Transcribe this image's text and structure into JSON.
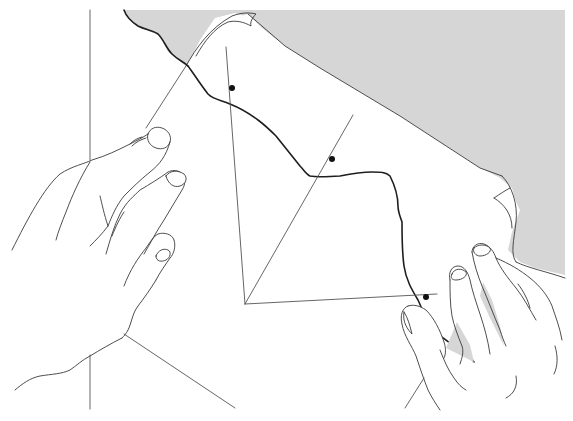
{
  "figure": {
    "description": "Two hands holding a sheet of paper with an angle construction drawn on it; a wavy traced line crosses the sheet, three marked points",
    "colors": {
      "background": "#ffffff",
      "shaded_surface": "#d6d6d6",
      "line": "#555555",
      "traced_line": "#1e1e1e",
      "point": "#111111"
    },
    "points": [
      {
        "name": "point-upper",
        "x": 232,
        "y": 88
      },
      {
        "name": "point-middle",
        "x": 332,
        "y": 159
      },
      {
        "name": "point-lower",
        "x": 426,
        "y": 297
      }
    ],
    "angle_vertex": {
      "x": 245,
      "y": 304
    }
  }
}
